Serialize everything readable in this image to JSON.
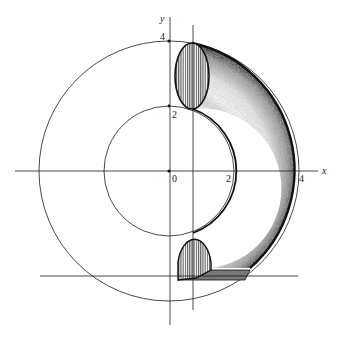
{
  "diagram": {
    "axes": {
      "x_label": "x",
      "y_label": "y",
      "origin_label": "0",
      "x_ticks": [
        "2",
        "4"
      ],
      "y_ticks": [
        "2",
        "4"
      ]
    },
    "circles": [
      {
        "name": "outer-circle",
        "radius_units": 4
      },
      {
        "name": "inner-circle",
        "radius_units": 2
      }
    ],
    "colors": {
      "ink": "#1a1a1a",
      "background": "#ffffff",
      "hatch": "#333333"
    }
  }
}
